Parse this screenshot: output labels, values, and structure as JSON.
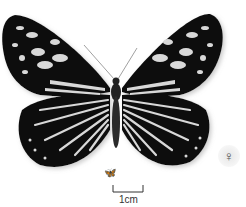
{
  "colors": {
    "wing_black": "#111111",
    "wing_spots": "#d8d8d8",
    "background": "#ffffff"
  },
  "scale_bar": {
    "label": "1cm"
  },
  "sex_symbol": "♀",
  "mini_icon": "butterfly-silhouette-icon"
}
